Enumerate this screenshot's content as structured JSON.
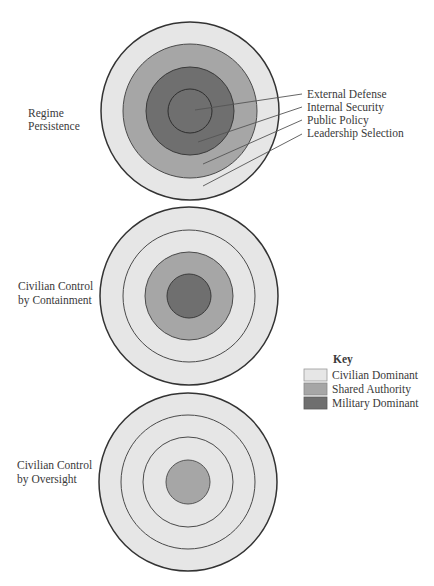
{
  "colors": {
    "civilian_dominant": "#e6e6e6",
    "shared_authority": "#a6a6a6",
    "military_dominant": "#6f6f6f",
    "outline": "#333333",
    "ring_line": "#4a4a4a",
    "leader_line": "#555555"
  },
  "diagrams": [
    {
      "title_line1": "Regime",
      "title_line2": "Persistence",
      "rings": [
        {
          "domain": "Leadership Selection",
          "control": "Shared Authority"
        },
        {
          "domain": "Public Policy",
          "control": "Shared Authority"
        },
        {
          "domain": "Internal Security",
          "control": "Military Dominant"
        },
        {
          "domain": "External Defense",
          "control": "Military Dominant"
        }
      ],
      "note": "outer band (beyond Leadership Selection) Civilian Dominant"
    },
    {
      "title_line1": "Civilian Control",
      "title_line2": "by Containment",
      "rings": [
        {
          "domain": "Leadership Selection",
          "control": "Civilian Dominant"
        },
        {
          "domain": "Public Policy",
          "control": "Civilian Dominant"
        },
        {
          "domain": "Internal Security",
          "control": "Shared Authority"
        },
        {
          "domain": "External Defense",
          "control": "Military Dominant"
        }
      ]
    },
    {
      "title_line1": "Civilian Control",
      "title_line2": "by Oversight",
      "rings": [
        {
          "domain": "Leadership Selection",
          "control": "Civilian Dominant"
        },
        {
          "domain": "Public Policy",
          "control": "Civilian Dominant"
        },
        {
          "domain": "Internal Security",
          "control": "Civilian Dominant"
        },
        {
          "domain": "External Defense",
          "control": "Shared Authority"
        }
      ]
    }
  ],
  "callouts": [
    {
      "label": "External Defense"
    },
    {
      "label": "Internal Security"
    },
    {
      "label": "Public Policy"
    },
    {
      "label": "Leadership Selection"
    }
  ],
  "key": {
    "title": "Key",
    "items": [
      {
        "label": "Civilian Dominant",
        "color": "#e6e6e6"
      },
      {
        "label": "Shared Authority",
        "color": "#a6a6a6"
      },
      {
        "label": "Military Dominant",
        "color": "#6f6f6f"
      }
    ]
  }
}
